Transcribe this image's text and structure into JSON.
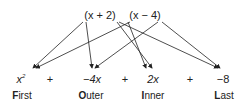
{
  "factors": {
    "left": "(x + 2)",
    "right": "(x − 4)"
  },
  "terms": [
    {
      "value": "x",
      "exp": "2",
      "x": 21
    },
    {
      "value": "+",
      "x": 50
    },
    {
      "value": "−4x",
      "x": 92
    },
    {
      "value": "+",
      "x": 125
    },
    {
      "value": "2x",
      "x": 153
    },
    {
      "value": "+",
      "x": 190
    },
    {
      "value": "−8",
      "x": 223
    }
  ],
  "labels": [
    {
      "first": "F",
      "rest": "irst",
      "x": 22
    },
    {
      "first": "O",
      "rest": "uter",
      "x": 91
    },
    {
      "first": "I",
      "rest": "nner",
      "x": 153
    },
    {
      "first": "L",
      "rest": "ast",
      "x": 224
    }
  ],
  "colors": {
    "ink": "#222222"
  }
}
